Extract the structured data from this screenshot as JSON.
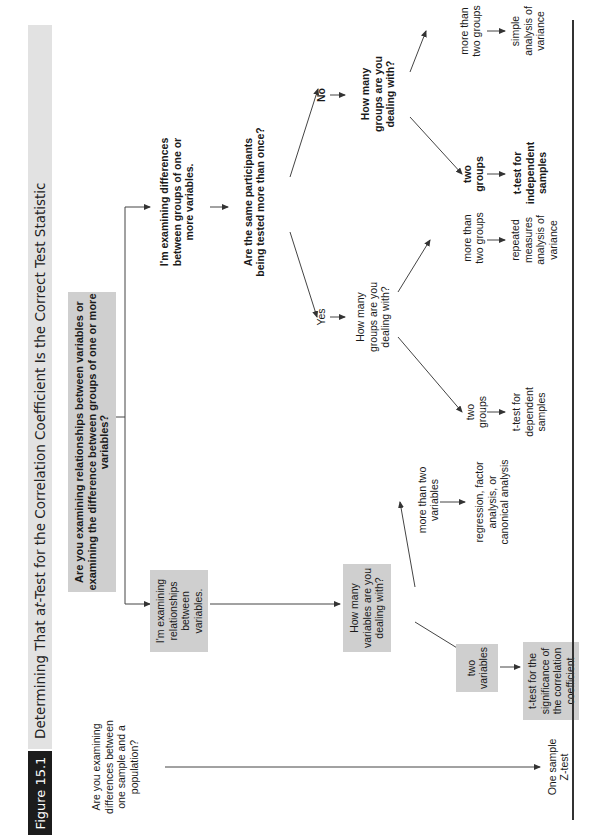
{
  "figure": {
    "label": "Figure 15.1",
    "title_prefix": "Determining That a ",
    "title_italic": "t",
    "title_suffix": "-Test for the Correlation Coefficient Is the Correct Test Statistic"
  },
  "nodes": {
    "root_question": "Are you examining relationships between variables or examining the difference between groups of one or more variables?",
    "relationships": "I'm examining relationships between variables.",
    "differences": "I'm examining differences between groups of one or more variables.",
    "how_many_variables": "How many variables are you dealing with?",
    "two_variables": "two variables",
    "more_than_two_variables": "more than two variables",
    "ttest_correlation": "t-test for the significance of the correlation coefficient",
    "regression": "regression, factor analysis, or canonical analysis",
    "same_participants": "Are the same participants being tested more than once?",
    "yes": "Yes",
    "no": "No",
    "how_many_groups_yes": "How many groups are you dealing with?",
    "how_many_groups_no": "How many groups are you dealing with?",
    "two_groups_yes": "two groups",
    "more_groups_yes": "more than two groups",
    "ttest_dependent": "t-test for dependent samples",
    "repeated_anova": "repeated measures analysis of variance",
    "two_groups_no": "two groups",
    "more_groups_no": "more than two groups",
    "ttest_independent": "t-test for independent samples",
    "simple_anova": "simple analysis of variance",
    "sample_population_question": "Are you examining differences between one sample and a population?",
    "one_sample_z": "One sample Z-test"
  },
  "colors": {
    "box_fill": "#cfcfcf",
    "header_bar": "#e2e2e2",
    "label_bg": "#1c1c1c",
    "line": "#333333"
  }
}
